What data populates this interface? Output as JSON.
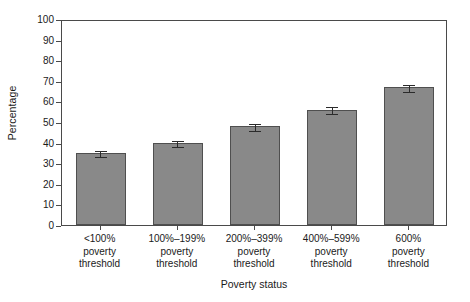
{
  "chart_data": {
    "type": "bar",
    "title": "",
    "xlabel": "Poverty status",
    "ylabel": "Percentage",
    "categories": [
      "<100%\npoverty\nthreshold",
      "100%–199%\npoverty\nthreshold",
      "200%–399%\npoverty\nthreshold",
      "400%–599%\npoverty\nthreshold",
      "600%\npoverty\nthreshold"
    ],
    "category_lines": [
      [
        "<100%",
        "poverty",
        "threshold"
      ],
      [
        "100%–199%",
        "poverty",
        "threshold"
      ],
      [
        "200%–399%",
        "poverty",
        "threshold"
      ],
      [
        "400%–599%",
        "poverty",
        "threshold"
      ],
      [
        "600%",
        "poverty",
        "threshold"
      ]
    ],
    "values": [
      35,
      40,
      48,
      56,
      67
    ],
    "error_low": [
      33.3,
      38.2,
      46.2,
      54.2,
      65.2
    ],
    "error_high": [
      36.8,
      41.9,
      49.8,
      58.1,
      68.8
    ],
    "ylim": [
      0,
      100
    ],
    "yticks": [
      0,
      10,
      20,
      30,
      40,
      50,
      60,
      70,
      80,
      90,
      100
    ],
    "ytick_labels": [
      "0",
      "10",
      "20",
      "30",
      "40",
      "50",
      "60",
      "70",
      "80",
      "90",
      "100"
    ],
    "grid": false,
    "legend": "none",
    "bar_color": "#898989",
    "bar_edge_color": "#4f4f4f",
    "error_color": "#2b2b2b",
    "frame_color": "#4a4a4a",
    "background": "#ffffff"
  }
}
